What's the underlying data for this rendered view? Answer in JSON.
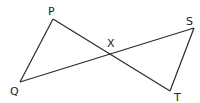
{
  "diagram": {
    "points": {
      "P": {
        "label": "P",
        "x": 53,
        "y": 19
      },
      "Q": {
        "label": "Q",
        "x": 20,
        "y": 82
      },
      "S": {
        "label": "S",
        "x": 194,
        "y": 28
      },
      "T": {
        "label": "T",
        "x": 170,
        "y": 91
      },
      "X": {
        "label": "X",
        "x": 110,
        "y": 55
      }
    },
    "segments": [
      {
        "from": "P",
        "to": "Q"
      },
      {
        "from": "P",
        "to": "T"
      },
      {
        "from": "Q",
        "to": "S"
      },
      {
        "from": "S",
        "to": "T"
      }
    ]
  }
}
